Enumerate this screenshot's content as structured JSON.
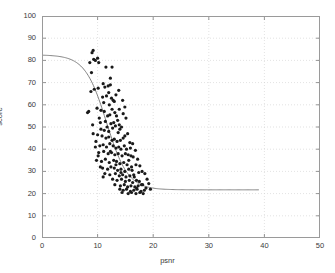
{
  "chart_data": {
    "type": "scatter",
    "title": "",
    "xlabel": "psnr",
    "ylabel": "score",
    "xlim": [
      0,
      50
    ],
    "ylim": [
      0,
      100
    ],
    "xticks": [
      0,
      10,
      20,
      30,
      40,
      50
    ],
    "yticks": [
      0,
      10,
      20,
      30,
      40,
      50,
      60,
      70,
      80,
      90,
      100
    ],
    "grid": true,
    "legend": null,
    "marker": "dot",
    "marker_color": "#1a1a1a",
    "marker_size": 1.6,
    "fit_curve": {
      "name": "logistic fit",
      "color": "#808080",
      "upper_asymptote": 82.5,
      "lower_asymptote": 21.7,
      "midpoint_x": 11.6,
      "slope": 0.52,
      "x_start": 0.0,
      "x_end": 39.0
    },
    "points": [
      [
        8.6,
        79.0
      ],
      [
        9.0,
        83.5
      ],
      [
        9.2,
        84.5
      ],
      [
        9.3,
        80.5
      ],
      [
        9.6,
        80.0
      ],
      [
        10.0,
        81.0
      ],
      [
        10.2,
        79.0
      ],
      [
        8.9,
        74.5
      ],
      [
        11.5,
        77.0
      ],
      [
        9.4,
        67.0
      ],
      [
        8.8,
        66.0
      ],
      [
        10.1,
        67.5
      ],
      [
        11.0,
        69.5
      ],
      [
        11.3,
        68.0
      ],
      [
        11.9,
        68.5
      ],
      [
        12.3,
        69.0
      ],
      [
        12.0,
        65.5
      ],
      [
        11.6,
        64.0
      ],
      [
        10.9,
        63.5
      ],
      [
        12.5,
        63.0
      ],
      [
        11.1,
        61.0
      ],
      [
        12.8,
        62.0
      ],
      [
        12.1,
        60.0
      ],
      [
        13.0,
        61.5
      ],
      [
        8.4,
        57.0
      ],
      [
        9.9,
        58.5
      ],
      [
        10.6,
        57.5
      ],
      [
        11.2,
        57.0
      ],
      [
        12.6,
        58.0
      ],
      [
        11.8,
        55.0
      ],
      [
        10.3,
        54.0
      ],
      [
        12.2,
        55.5
      ],
      [
        13.1,
        56.5
      ],
      [
        13.4,
        55.0
      ],
      [
        10.5,
        52.0
      ],
      [
        11.4,
        52.5
      ],
      [
        12.4,
        51.5
      ],
      [
        12.9,
        52.0
      ],
      [
        13.6,
        53.0
      ],
      [
        13.9,
        51.0
      ],
      [
        11.7,
        50.0
      ],
      [
        12.7,
        49.5
      ],
      [
        13.2,
        50.5
      ],
      [
        14.0,
        49.0
      ],
      [
        14.3,
        50.0
      ],
      [
        9.2,
        47.0
      ],
      [
        10.0,
        46.5
      ],
      [
        10.8,
        46.0
      ],
      [
        11.5,
        45.0
      ],
      [
        12.0,
        45.5
      ],
      [
        12.6,
        44.0
      ],
      [
        13.0,
        44.5
      ],
      [
        13.5,
        43.5
      ],
      [
        14.1,
        44.0
      ],
      [
        14.6,
        45.0
      ],
      [
        9.6,
        41.0
      ],
      [
        10.4,
        41.5
      ],
      [
        11.0,
        42.0
      ],
      [
        11.6,
        41.0
      ],
      [
        12.2,
        42.5
      ],
      [
        12.8,
        41.5
      ],
      [
        13.3,
        40.5
      ],
      [
        13.8,
        41.0
      ],
      [
        14.2,
        40.0
      ],
      [
        14.8,
        41.5
      ],
      [
        15.2,
        40.0
      ],
      [
        10.2,
        38.5
      ],
      [
        11.1,
        39.0
      ],
      [
        11.9,
        38.0
      ],
      [
        12.5,
        38.5
      ],
      [
        13.1,
        37.5
      ],
      [
        13.7,
        38.0
      ],
      [
        14.4,
        37.0
      ],
      [
        15.0,
        38.0
      ],
      [
        15.5,
        37.5
      ],
      [
        16.0,
        37.0
      ],
      [
        9.8,
        35.0
      ],
      [
        10.7,
        34.5
      ],
      [
        11.4,
        35.5
      ],
      [
        12.1,
        34.0
      ],
      [
        12.9,
        35.0
      ],
      [
        13.4,
        34.5
      ],
      [
        14.0,
        33.5
      ],
      [
        14.7,
        34.0
      ],
      [
        15.3,
        33.0
      ],
      [
        10.9,
        31.5
      ],
      [
        11.8,
        31.0
      ],
      [
        12.4,
        32.0
      ],
      [
        13.0,
        31.5
      ],
      [
        13.6,
        30.5
      ],
      [
        14.2,
        31.0
      ],
      [
        14.9,
        30.0
      ],
      [
        15.6,
        31.0
      ],
      [
        16.2,
        30.5
      ],
      [
        11.3,
        29.0
      ],
      [
        12.2,
        28.5
      ],
      [
        13.2,
        29.0
      ],
      [
        13.9,
        28.0
      ],
      [
        14.5,
        28.5
      ],
      [
        15.1,
        27.5
      ],
      [
        15.8,
        28.0
      ],
      [
        16.5,
        28.5
      ],
      [
        12.7,
        26.5
      ],
      [
        13.5,
        26.0
      ],
      [
        14.3,
        26.5
      ],
      [
        15.0,
        25.5
      ],
      [
        15.7,
        26.0
      ],
      [
        16.3,
        25.0
      ],
      [
        17.0,
        26.0
      ],
      [
        17.5,
        25.5
      ],
      [
        13.1,
        24.0
      ],
      [
        14.1,
        23.5
      ],
      [
        14.8,
        24.0
      ],
      [
        15.4,
        23.0
      ],
      [
        16.0,
        23.5
      ],
      [
        16.7,
        23.0
      ],
      [
        17.3,
        23.5
      ],
      [
        17.9,
        24.0
      ],
      [
        14.0,
        22.0
      ],
      [
        14.6,
        21.5
      ],
      [
        15.2,
        22.0
      ],
      [
        15.9,
        21.0
      ],
      [
        16.5,
        21.5
      ],
      [
        17.1,
        22.0
      ],
      [
        17.8,
        21.0
      ],
      [
        18.4,
        21.5
      ],
      [
        14.4,
        20.5
      ],
      [
        15.5,
        20.0
      ],
      [
        16.1,
        20.5
      ],
      [
        16.9,
        20.0
      ],
      [
        17.6,
        20.5
      ],
      [
        18.2,
        20.0
      ],
      [
        12.3,
        72.0
      ],
      [
        12.6,
        77.0
      ],
      [
        13.8,
        66.5
      ],
      [
        13.3,
        64.5
      ],
      [
        14.5,
        62.0
      ],
      [
        14.9,
        59.0
      ],
      [
        13.9,
        58.0
      ],
      [
        14.6,
        56.0
      ],
      [
        15.1,
        54.0
      ],
      [
        12.0,
        48.0
      ],
      [
        11.2,
        48.5
      ],
      [
        10.6,
        49.0
      ],
      [
        15.4,
        47.0
      ],
      [
        14.9,
        46.0
      ],
      [
        15.8,
        43.0
      ],
      [
        16.3,
        42.5
      ],
      [
        16.8,
        39.5
      ],
      [
        15.9,
        40.5
      ],
      [
        16.4,
        36.5
      ],
      [
        17.2,
        35.5
      ],
      [
        16.9,
        33.0
      ],
      [
        17.6,
        32.5
      ],
      [
        18.0,
        30.0
      ],
      [
        18.5,
        29.0
      ],
      [
        18.9,
        26.5
      ],
      [
        19.2,
        24.5
      ],
      [
        18.7,
        22.5
      ],
      [
        19.5,
        22.0
      ],
      [
        8.2,
        56.5
      ],
      [
        9.1,
        51.0
      ],
      [
        9.7,
        43.5
      ],
      [
        10.1,
        37.0
      ],
      [
        10.5,
        32.0
      ],
      [
        11.0,
        27.5
      ],
      [
        13.7,
        47.5
      ],
      [
        12.3,
        39.0
      ],
      [
        13.3,
        33.0
      ],
      [
        14.2,
        29.5
      ],
      [
        16.1,
        32.0
      ],
      [
        15.6,
        35.0
      ],
      [
        17.4,
        29.5
      ],
      [
        16.6,
        27.5
      ],
      [
        18.1,
        24.0
      ],
      [
        17.0,
        22.5
      ]
    ]
  }
}
